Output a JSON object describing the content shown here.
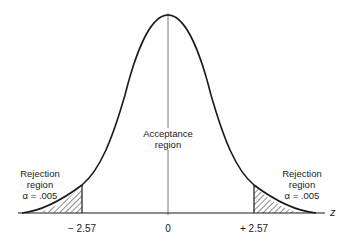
{
  "diagram": {
    "type": "normal-distribution-two-tailed-test",
    "acceptance_region": {
      "line1": "Acceptance",
      "line2": "region"
    },
    "left_rejection": {
      "line1": "Rejection",
      "line2": "region",
      "line3": "α = .005"
    },
    "right_rejection": {
      "line1": "Rejection",
      "line2": "region",
      "line3": "α = .005"
    },
    "axis": {
      "label": "z",
      "ticks": [
        {
          "label": "− 2.57",
          "value": -2.57
        },
        {
          "label": "0",
          "value": 0
        },
        {
          "label": "+ 2.57",
          "value": 2.57
        }
      ]
    },
    "colors": {
      "line": "#1a1a1a",
      "background": "#ffffff"
    }
  }
}
